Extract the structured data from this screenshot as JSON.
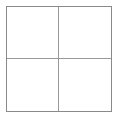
{
  "figure": {
    "type": "grid-diagram",
    "title": "",
    "columns": 2,
    "rows": 2,
    "background_color": "#ffffff",
    "outer_border_color": "#8a8a8a",
    "divider_color": "#9a9a9a",
    "outer_border_width_px": 1,
    "divider_width_px": 1,
    "frame": {
      "left_px": 6,
      "top_px": 6,
      "width_px": 106,
      "height_px": 106
    },
    "dividers": {
      "vertical_x_px": 60,
      "horizontal_y_px": 60
    }
  },
  "cells": [
    {
      "id": "top-left",
      "label": ""
    },
    {
      "id": "top-right",
      "label": ""
    },
    {
      "id": "bottom-left",
      "label": ""
    },
    {
      "id": "bottom-right",
      "label": ""
    }
  ]
}
